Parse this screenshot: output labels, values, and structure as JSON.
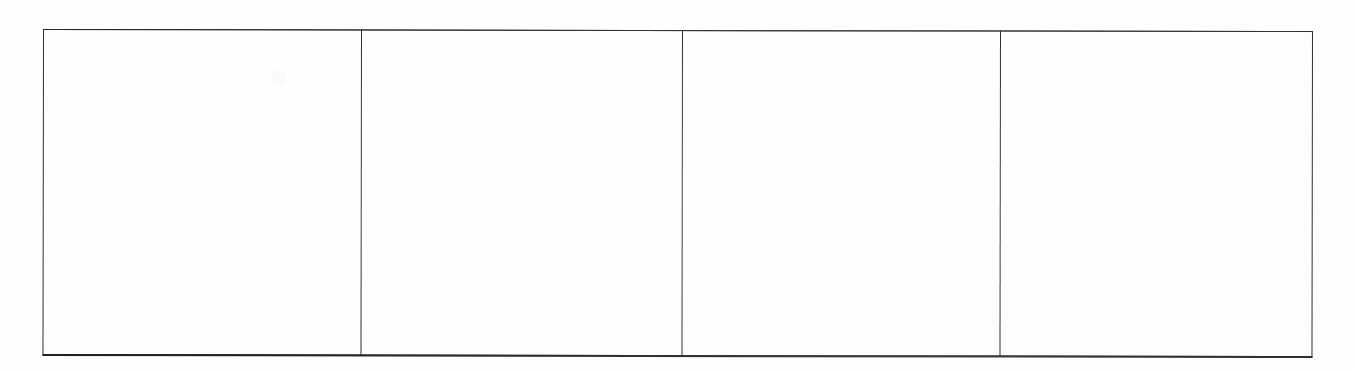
{
  "document": {
    "kind": "scanned-table",
    "title": "",
    "caption": "",
    "note": ""
  },
  "table": {
    "row_count": 1,
    "column_count": 4,
    "has_header": false,
    "border_color": "#2e2f31",
    "rule_color": "#34353a",
    "background_color": "#ffffff",
    "columns": [
      {
        "id": "column-1",
        "header": "",
        "width_pct": 25.0
      },
      {
        "id": "column-2",
        "header": "",
        "width_pct": 25.3
      },
      {
        "id": "column-3",
        "header": "",
        "width_pct": 25.0
      },
      {
        "id": "column-4",
        "header": "",
        "width_pct": 24.7
      }
    ],
    "rows": [
      {
        "id": "row-1",
        "cells": [
          {
            "id": "cell-r1c1",
            "text": ""
          },
          {
            "id": "cell-r1c2",
            "text": ""
          },
          {
            "id": "cell-r1c3",
            "text": ""
          },
          {
            "id": "cell-r1c4",
            "text": ""
          }
        ]
      }
    ]
  },
  "artifacts": {
    "smudge_label": "",
    "smudge_present": true
  }
}
